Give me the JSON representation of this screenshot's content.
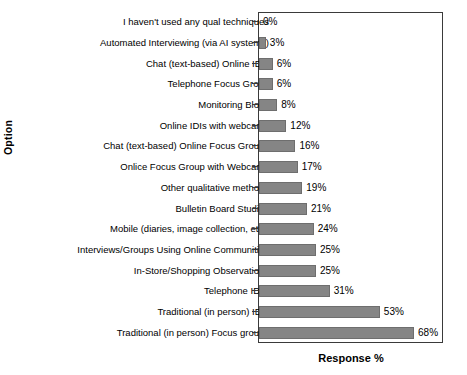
{
  "figure": {
    "title_sliver": "",
    "x_axis_title": "Response %",
    "y_axis_title": "Option"
  },
  "chart_data": {
    "type": "bar",
    "orientation": "horizontal",
    "title": "",
    "xlabel": "Response %",
    "ylabel": "Option",
    "xlim": [
      0,
      81
    ],
    "grid": false,
    "legend": null,
    "bar_color": "#858585",
    "frame_color": "#3a3a3a",
    "value_suffix": "%",
    "categories": [
      "I haven't used any qual techniques",
      "Automated Interviewing (via AI systems)",
      "Chat (text-based) Online IDIs",
      "Telephone Focus Group",
      "Monitoring Blogs",
      "Online IDIs with webcams",
      "Chat (text-based) Online Focus Groups",
      "Onlice Focus Group with Webcams",
      "Other qualitative methods",
      "Bulletin Board Studies",
      "Mobile (diaries, image collection, etc.)",
      "Interviews/Groups Using Online Communities",
      "In-Store/Shopping Observations",
      "Telephone IDIS",
      "Traditional (in person) IDIs",
      "Traditional (in person) Focus groups"
    ],
    "values": [
      0,
      3,
      6,
      6,
      8,
      12,
      16,
      17,
      19,
      21,
      24,
      25,
      25,
      31,
      53,
      68
    ],
    "value_labels": [
      "0%",
      "3%",
      "6%",
      "6%",
      "8%",
      "12%",
      "16%",
      "17%",
      "19%",
      "21%",
      "24%",
      "25%",
      "25%",
      "31%",
      "53%",
      "68%"
    ]
  }
}
